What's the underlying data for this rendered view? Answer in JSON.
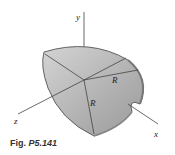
{
  "figure": {
    "caption_prefix": "Fig.",
    "caption_number": "P5.141",
    "axes": {
      "y": "y",
      "x": "x",
      "z": "z"
    },
    "radius_labels": [
      "R",
      "R"
    ],
    "colors": {
      "shell_fill": "#b8b8b8",
      "shell_edge": "#555555",
      "axis": "#444444",
      "rim": "#8a8a8a"
    }
  }
}
